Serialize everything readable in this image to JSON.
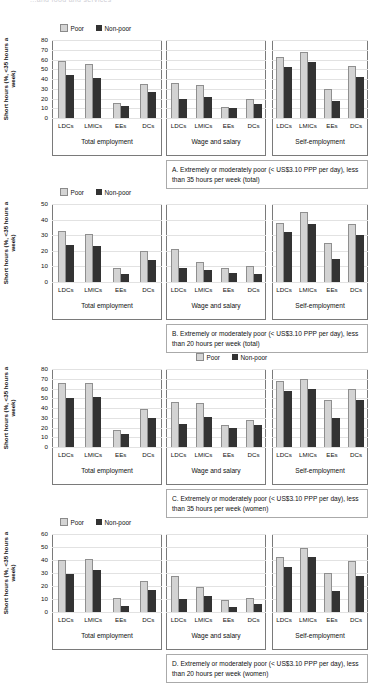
{
  "figure": {
    "top_title": "...and food and services",
    "ylabel": "Short hours (%, <35 hours a week)",
    "legend": {
      "poor": "Poor",
      "non_poor": "Non-poor"
    },
    "colors": {
      "poor": "#d3d3d3",
      "non_poor": "#333333",
      "axis": "#7a7a7a",
      "grid": "#e2e2e2"
    },
    "groups": [
      "Total employment",
      "Wage and salary",
      "Self-employment"
    ],
    "categories": [
      "LDCs",
      "LMICs",
      "EEs",
      "DCs"
    ]
  },
  "chart_data": [
    {
      "type": "bar",
      "panel": "A",
      "title": "A. Extremely or moderately poor (< US$3.10 PPP per day), less than 35 hours per week (total)",
      "ylabel": "Short hours (%, <35 hours a week)",
      "xlabel": "",
      "ylim": [
        0,
        80
      ],
      "yticks": [
        0,
        10,
        20,
        30,
        40,
        50,
        60,
        70,
        80
      ],
      "grid": true,
      "legend_position": "top-left",
      "categories": [
        "LDCs",
        "LMICs",
        "EEs",
        "DCs"
      ],
      "groups": [
        {
          "name": "Total employment",
          "series": [
            {
              "name": "Poor",
              "values": [
                58,
                55,
                15,
                35
              ]
            },
            {
              "name": "Non-poor",
              "values": [
                44,
                41,
                12,
                27
              ]
            }
          ]
        },
        {
          "name": "Wage and salary",
          "series": [
            {
              "name": "Poor",
              "values": [
                36,
                34,
                11,
                19
              ]
            },
            {
              "name": "Non-poor",
              "values": [
                20,
                22,
                10,
                14
              ]
            }
          ]
        },
        {
          "name": "Self-employment",
          "series": [
            {
              "name": "Poor",
              "values": [
                63,
                68,
                30,
                53
              ]
            },
            {
              "name": "Non-poor",
              "values": [
                52,
                57,
                17,
                42
              ]
            }
          ]
        }
      ]
    },
    {
      "type": "bar",
      "panel": "B",
      "title": "B. Extremely or moderately poor (< US$3.10 PPP per day), less than 20 hours per week (total)",
      "ylabel": "Short hours (%, <35 hours a week)",
      "xlabel": "",
      "ylim": [
        0,
        50
      ],
      "yticks": [
        0,
        10,
        20,
        30,
        40,
        50
      ],
      "grid": true,
      "legend_position": "top-left",
      "categories": [
        "LDCs",
        "LMICs",
        "EEs",
        "DCs"
      ],
      "groups": [
        {
          "name": "Total employment",
          "series": [
            {
              "name": "Poor",
              "values": [
                33,
                31,
                9,
                20
              ]
            },
            {
              "name": "Non-poor",
              "values": [
                24,
                23,
                5,
                14
              ]
            }
          ]
        },
        {
          "name": "Wage and salary",
          "series": [
            {
              "name": "Poor",
              "values": [
                21,
                13,
                9,
                10
              ]
            },
            {
              "name": "Non-poor",
              "values": [
                9,
                8,
                6,
                5
              ]
            }
          ]
        },
        {
          "name": "Self-employment",
          "series": [
            {
              "name": "Poor",
              "values": [
                38,
                45,
                25,
                37
              ]
            },
            {
              "name": "Non-poor",
              "values": [
                32,
                37,
                15,
                30
              ]
            }
          ]
        }
      ]
    },
    {
      "type": "bar",
      "panel": "C",
      "title": "C. Extremely or moderately poor (< US$3.10 PPP per day), less than 35 hours per week (women)",
      "ylabel": "Short hours (%, <35 hours a week)",
      "xlabel": "",
      "ylim": [
        0,
        80
      ],
      "yticks": [
        0,
        10,
        20,
        30,
        40,
        50,
        60,
        70,
        80
      ],
      "grid": true,
      "legend_position": "top-center",
      "categories": [
        "LDCs",
        "LMICs",
        "EEs",
        "DCs"
      ],
      "groups": [
        {
          "name": "Total employment",
          "series": [
            {
              "name": "Poor",
              "values": [
                66,
                66,
                17,
                39
              ]
            },
            {
              "name": "Non-poor",
              "values": [
                50,
                51,
                13,
                30
              ]
            }
          ]
        },
        {
          "name": "Wage and salary",
          "series": [
            {
              "name": "Poor",
              "values": [
                46,
                45,
                23,
                28
              ]
            },
            {
              "name": "Non-poor",
              "values": [
                24,
                31,
                20,
                23
              ]
            }
          ]
        },
        {
          "name": "Self-employment",
          "series": [
            {
              "name": "Poor",
              "values": [
                68,
                70,
                48,
                59
              ]
            },
            {
              "name": "Non-poor",
              "values": [
                57,
                60,
                30,
                48
              ]
            }
          ]
        }
      ]
    },
    {
      "type": "bar",
      "panel": "D",
      "title": "D. Extremely or moderately poor (< US$3.10 PPP per day), less than 20 hours per week (women)",
      "ylabel": "Short hours (%, <35 hours a week)",
      "xlabel": "",
      "ylim": [
        0,
        60
      ],
      "yticks": [
        0,
        10,
        20,
        30,
        40,
        50,
        60
      ],
      "grid": true,
      "legend_position": "top-left",
      "categories": [
        "LDCs",
        "LMICs",
        "EEs",
        "DCs"
      ],
      "groups": [
        {
          "name": "Total employment",
          "series": [
            {
              "name": "Poor",
              "values": [
                40,
                41,
                11,
                24
              ]
            },
            {
              "name": "Non-poor",
              "values": [
                29,
                32,
                5,
                17
              ]
            }
          ]
        },
        {
          "name": "Wage and salary",
          "series": [
            {
              "name": "Poor",
              "values": [
                28,
                19,
                9,
                11
              ]
            },
            {
              "name": "Non-poor",
              "values": [
                10,
                12,
                4,
                6
              ]
            }
          ]
        },
        {
          "name": "Self-employment",
          "series": [
            {
              "name": "Poor",
              "values": [
                42,
                49,
                30,
                39
              ]
            },
            {
              "name": "Non-poor",
              "values": [
                35,
                42,
                16,
                28
              ]
            }
          ]
        }
      ]
    }
  ]
}
